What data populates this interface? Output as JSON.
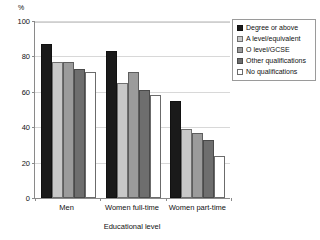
{
  "chart_data": {
    "type": "bar",
    "title": "",
    "xlabel": "Educational level",
    "ylabel": "%",
    "ylim": [
      0,
      100
    ],
    "yticks": [
      0,
      20,
      40,
      60,
      80,
      100
    ],
    "grid": true,
    "legend_position": "top-right",
    "categories": [
      "Men",
      "Women full-time",
      "Women part-time"
    ],
    "series": [
      {
        "name": "Degree or above",
        "color": "#1a1a1a",
        "values": [
          87,
          83,
          55
        ]
      },
      {
        "name": "A level/equivalent",
        "color": "#c8c8c8",
        "values": [
          77,
          65,
          39
        ]
      },
      {
        "name": "O level/GCSE",
        "color": "#9b9b9b",
        "values": [
          77,
          71,
          37
        ]
      },
      {
        "name": "Other qualifications",
        "color": "#6e6e6e",
        "values": [
          73,
          61,
          33
        ]
      },
      {
        "name": "No qualifications",
        "color": "#ffffff",
        "values": [
          71,
          58,
          24
        ]
      }
    ]
  },
  "axes": {
    "y_unit_label": "%",
    "y_tick_labels": [
      "100",
      "80",
      "60",
      "40",
      "20",
      "0"
    ],
    "x_tick_labels": [
      "Men",
      "Women full-time",
      "Women part-time"
    ],
    "x_axis_title": "Educational level"
  },
  "legend": {
    "items": [
      {
        "label": "Degree or above",
        "swatch": "black-square-swatch"
      },
      {
        "label": "A level/equivalent",
        "swatch": "light-gray-square-swatch"
      },
      {
        "label": "O level/GCSE",
        "swatch": "medium-gray-square-swatch"
      },
      {
        "label": "Other qualifications",
        "swatch": "dark-gray-square-swatch"
      },
      {
        "label": "No qualifications",
        "swatch": "white-square-swatch"
      }
    ]
  }
}
